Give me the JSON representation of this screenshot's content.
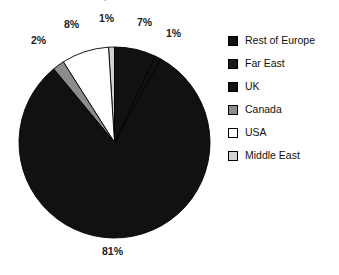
{
  "chart_data": {
    "type": "pie",
    "title": "Table 1.4 UK Export Markets 1998 2005",
    "xlabel": "",
    "ylabel": "",
    "unit": "percent",
    "legend_position": "right",
    "grid": false,
    "categories": [
      "Rest of Europe",
      "Far East",
      "UK",
      "Canada",
      "USA",
      "Middle East"
    ],
    "values": [
      81,
      7,
      1,
      2,
      8,
      1
    ],
    "labels": [
      "81%",
      "7%",
      "1%",
      "2%",
      "8%",
      "1%"
    ],
    "colors": [
      "#111111",
      "#111111",
      "#111111",
      "#8c8c8c",
      "#ffffff",
      "#d0d0d0"
    ],
    "slices": [
      {
        "name": "Middle East",
        "value": 1,
        "label": "1%",
        "color": "#d0d0d0"
      },
      {
        "name": "USA",
        "value": 8,
        "label": "8%",
        "color": "#ffffff"
      },
      {
        "name": "Canada",
        "value": 2,
        "label": "2%",
        "color": "#8c8c8c"
      },
      {
        "name": "Rest of Europe",
        "value": 81,
        "label": "81%",
        "color": "#111111"
      },
      {
        "name": "UK",
        "value": 1,
        "label": "1%",
        "color": "#111111"
      },
      {
        "name": "Far East",
        "value": 7,
        "label": "7%",
        "color": "#111111"
      }
    ]
  },
  "title": {
    "text": "Table 1.4 UK Export Markets 1998 2005"
  },
  "pie": {
    "labels": {
      "canada": "2%",
      "usa": "8%",
      "middle_east": "1%",
      "far_east": "7%",
      "uk": "1%",
      "rest_of_europe": "81%"
    }
  },
  "legend": {
    "items": [
      {
        "label": "Rest of Europe",
        "color": "#111111"
      },
      {
        "label": "Far East",
        "color": "#1a1a1a"
      },
      {
        "label": "UK",
        "color": "#111111"
      },
      {
        "label": "Canada",
        "color": "#8c8c8c"
      },
      {
        "label": "USA",
        "color": "#ffffff"
      },
      {
        "label": "Middle East",
        "color": "#d4d4d4"
      }
    ]
  }
}
